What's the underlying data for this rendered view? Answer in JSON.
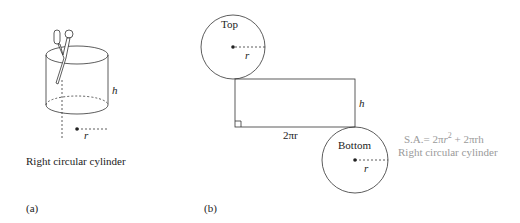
{
  "panel_a": {
    "tag": "(a)",
    "caption": "Right circular cylinder",
    "height_label": "h",
    "radius_label": "r"
  },
  "panel_b": {
    "tag": "(b)",
    "top_label": "Top",
    "bottom_label": "Bottom",
    "top_radius_label": "r",
    "bottom_radius_label": "r",
    "rect_height_label": "h",
    "rect_width_label": "2πr",
    "formula_prefix": "S.A.= 2π",
    "formula_r": "r",
    "formula_exp": "2",
    "formula_suffix": " + 2πrh",
    "formula_caption": "Right circular cylinder"
  },
  "colors": {
    "stroke": "#222222",
    "formula_text": "#9a9a9a"
  }
}
